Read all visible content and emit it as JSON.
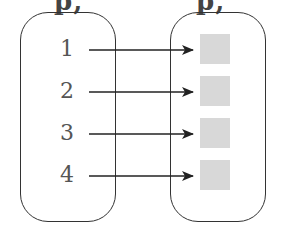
{
  "header": {
    "left_cut_text": "p,",
    "right_cut_text": "p,"
  },
  "diagram": {
    "type": "mapping",
    "domain_set": {
      "elements": [
        "1",
        "2",
        "3",
        "4"
      ]
    },
    "codomain_set": {
      "elements": [
        "",
        "",
        "",
        ""
      ],
      "element_shape": "gray-square"
    },
    "mappings": [
      {
        "from": "1",
        "to": 0
      },
      {
        "from": "2",
        "to": 1
      },
      {
        "from": "3",
        "to": 2
      },
      {
        "from": "4",
        "to": 3
      }
    ],
    "colors": {
      "stroke": "#333333",
      "square_fill": "#d8d8d8",
      "number": "#555555"
    }
  }
}
